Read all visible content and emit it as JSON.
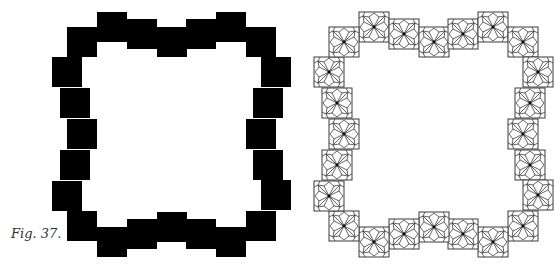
{
  "caption": "Fig. 37.",
  "tile_size": 30,
  "colors": {
    "solid_fill": "#000000",
    "line": "#3a3a3a",
    "background": "#ffffff"
  },
  "figures": [
    {
      "name": "solid-frame",
      "style": "solid",
      "origin_x": 38
    },
    {
      "name": "patterned-frame",
      "style": "pattern",
      "origin_x": 300
    }
  ],
  "tile_centers": [
    [
      74,
      27
    ],
    [
      104,
      34
    ],
    [
      134,
      42
    ],
    [
      163,
      34
    ],
    [
      193,
      27
    ],
    [
      223,
      42
    ],
    [
      238,
      72
    ],
    [
      230,
      103
    ],
    [
      223,
      134
    ],
    [
      230,
      165
    ],
    [
      238,
      195
    ],
    [
      223,
      226
    ],
    [
      193,
      242
    ],
    [
      163,
      234
    ],
    [
      134,
      227
    ],
    [
      104,
      234
    ],
    [
      74,
      242
    ],
    [
      44,
      226
    ],
    [
      29,
      196
    ],
    [
      37,
      165
    ],
    [
      44,
      134
    ],
    [
      37,
      103
    ],
    [
      29,
      72
    ],
    [
      44,
      42
    ]
  ]
}
